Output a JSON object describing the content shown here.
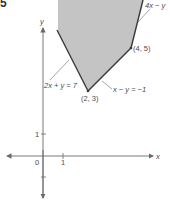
{
  "figure": {
    "corner_mark": "5",
    "region": {
      "fill": "#c4c4c4",
      "edge_color": "#3a3a3a",
      "description": "unbounded feasible region above constraints"
    },
    "axes": {
      "x_label": "x",
      "y_label": "y",
      "origin_label": "0",
      "x_tick_label": "1",
      "y_tick_label": "1",
      "color": "#6a6a6a"
    },
    "constraints": [
      {
        "label": "2x + y = 7"
      },
      {
        "label": "x − y = −1"
      },
      {
        "label": "4x − y"
      }
    ],
    "vertices": [
      {
        "label": "(2, 3)"
      },
      {
        "label": "(4, 5)"
      }
    ]
  }
}
